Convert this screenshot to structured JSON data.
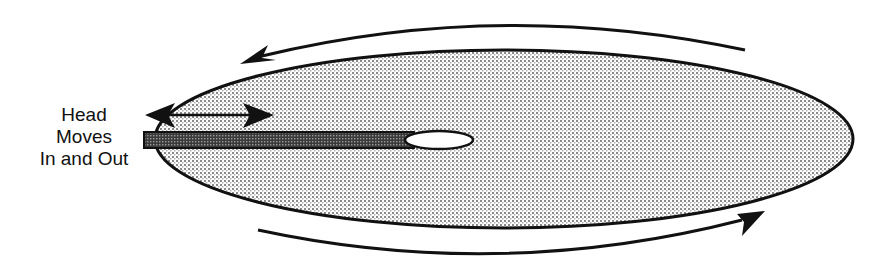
{
  "diagram": {
    "label": {
      "lines": [
        "Head",
        "Moves",
        "In and Out"
      ]
    },
    "elements": {
      "platter": "rotating disk platter (stippled ellipse)",
      "head_arm": "read/write head arm",
      "head_tip": "head tip",
      "rotation_arrow_top": "counter-clockwise rotation arrow (top, pointing left)",
      "rotation_arrow_bottom": "rotation arrow (bottom, pointing right)",
      "head_motion_arrow": "double-headed arrow showing head movement in and out"
    },
    "colors": {
      "stroke": "#111111",
      "platter_fill": "#d9d9d9",
      "arm_fill": "#555555",
      "tip_fill": "#ffffff"
    }
  }
}
